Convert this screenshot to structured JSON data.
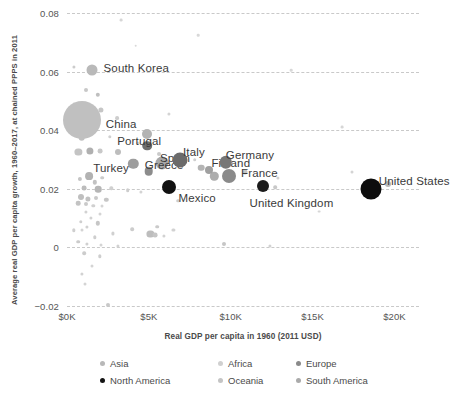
{
  "chart_data": {
    "type": "scatter",
    "title": "",
    "xlabel": "Real GDP per capita in 1960 (2011 USD)",
    "ylabel": "Average real GDP per capita growth, 1960–2017, at chained PPPS in 2011",
    "xlim": [
      0,
      21500
    ],
    "ylim": [
      -0.02,
      0.08
    ],
    "xticks": [
      {
        "value": 0,
        "label": "$0K"
      },
      {
        "value": 5000,
        "label": "$5K"
      },
      {
        "value": 10000,
        "label": "$10K"
      },
      {
        "value": 15000,
        "label": "$15K"
      },
      {
        "value": 20000,
        "label": "$20K"
      }
    ],
    "yticks": [
      {
        "value": 0.08,
        "label": "0.08"
      },
      {
        "value": 0.06,
        "label": "0.06"
      },
      {
        "value": 0.04,
        "label": "0.04"
      },
      {
        "value": 0.02,
        "label": "0.02"
      },
      {
        "value": 0,
        "label": "0"
      },
      {
        "value": -0.02,
        "label": "−0.02"
      }
    ],
    "grid": "horizontal-dashed",
    "legend_position": "bottom",
    "size_encoding": "population",
    "color_encoding": "continent",
    "legend": [
      {
        "name": "Asia",
        "color": "#b8b8b8"
      },
      {
        "name": "Africa",
        "color": "#d0d0d0"
      },
      {
        "name": "Europe",
        "color": "#8a8a8a"
      },
      {
        "name": "North America",
        "color": "#141414"
      },
      {
        "name": "Oceania",
        "color": "#c4c4c4"
      },
      {
        "name": "South America",
        "color": "#aaaaaa"
      }
    ],
    "labeled_points": [
      {
        "name": "South Korea",
        "x": 1500,
        "y": 0.0605,
        "r": 5.5,
        "color": "#b9b9b9",
        "label_dx": 12,
        "label_dy": -8
      },
      {
        "name": "China",
        "x": 900,
        "y": 0.0435,
        "r": 19,
        "color": "#c0c0c0",
        "label_dx": 24,
        "label_dy": -2
      },
      {
        "name": "Portugal",
        "x": 4900,
        "y": 0.0347,
        "r": 4.8,
        "color": "#6e6e6e",
        "label_dx": -30,
        "label_dy": -11
      },
      {
        "name": "Turkey",
        "x": 4050,
        "y": 0.0285,
        "r": 5.2,
        "color": "#9d9d9d",
        "label_dx": -40,
        "label_dy": -2
      },
      {
        "name": "Spain",
        "x": 5800,
        "y": 0.0287,
        "r": 6.5,
        "color": "#a8a8a8",
        "label_dx": -2,
        "label_dy": -11
      },
      {
        "name": "Greece",
        "x": 5000,
        "y": 0.026,
        "r": 4.3,
        "color": "#8c8c8c",
        "label_dx": -4,
        "label_dy": -12
      },
      {
        "name": "Italy",
        "x": 6900,
        "y": 0.03,
        "r": 7.5,
        "color": "#6b6b6b",
        "label_dx": 3,
        "label_dy": -14
      },
      {
        "name": "Mexico",
        "x": 6200,
        "y": 0.0205,
        "r": 7.0,
        "color": "#111111",
        "label_dx": 10,
        "label_dy": 5
      },
      {
        "name": "Finland",
        "x": 8700,
        "y": 0.0264,
        "r": 4.0,
        "color": "#a0a0a0",
        "label_dx": 2,
        "label_dy": -13
      },
      {
        "name": "Germany",
        "x": 9700,
        "y": 0.029,
        "r": 6.2,
        "color": "#777777",
        "label_dx": 0,
        "label_dy": -13
      },
      {
        "name": "France",
        "x": 9900,
        "y": 0.0243,
        "r": 7.0,
        "color": "#8a8a8a",
        "label_dx": 12,
        "label_dy": -9
      },
      {
        "name": "United Kingdom",
        "x": 12000,
        "y": 0.021,
        "r": 6.0,
        "color": "#1b1b1b",
        "label_dx": -14,
        "label_dy": 11
      },
      {
        "name": "United States",
        "x": 18550,
        "y": 0.0201,
        "r": 10.5,
        "color": "#0d0d0d",
        "label_dx": 8,
        "label_dy": -14
      }
    ],
    "unlabeled_points": [
      {
        "x": 400,
        "y": 0.0615,
        "r": 1.6,
        "color": "#cccccc"
      },
      {
        "x": 1150,
        "y": 0.0538,
        "r": 2.0,
        "color": "#c8c8c8"
      },
      {
        "x": 1900,
        "y": 0.052,
        "r": 2.2,
        "color": "#bfbfbf"
      },
      {
        "x": 1350,
        "y": 0.0478,
        "r": 3.2,
        "color": "#c2c2c2"
      },
      {
        "x": 2050,
        "y": 0.0468,
        "r": 2.6,
        "color": "#c6c6c6"
      },
      {
        "x": 1250,
        "y": 0.0468,
        "r": 5.8,
        "color": "#b4b4b4"
      },
      {
        "x": 400,
        "y": 0.049,
        "r": 1.5,
        "color": "#d2d2d2"
      },
      {
        "x": 1700,
        "y": 0.0418,
        "r": 1.8,
        "color": "#cfcfcf"
      },
      {
        "x": 3050,
        "y": 0.044,
        "r": 1.9,
        "color": "#cdcdcd"
      },
      {
        "x": 6200,
        "y": 0.0455,
        "r": 1.6,
        "color": "#d4d4d4"
      },
      {
        "x": 900,
        "y": 0.0375,
        "r": 3.3,
        "color": "#c0c0c0"
      },
      {
        "x": 2600,
        "y": 0.0378,
        "r": 1.7,
        "color": "#d0d0d0"
      },
      {
        "x": 4900,
        "y": 0.0387,
        "r": 5.0,
        "color": "#b3b3b3"
      },
      {
        "x": 4350,
        "y": 0.0358,
        "r": 1.6,
        "color": "#d2d2d2"
      },
      {
        "x": 700,
        "y": 0.0327,
        "r": 3.6,
        "color": "#c4c4c4"
      },
      {
        "x": 1400,
        "y": 0.0328,
        "r": 3.6,
        "color": "#b0b0b0"
      },
      {
        "x": 2000,
        "y": 0.0328,
        "r": 2.4,
        "color": "#c8c8c8"
      },
      {
        "x": 3100,
        "y": 0.0327,
        "r": 3.0,
        "color": "#bdbdbd"
      },
      {
        "x": 5600,
        "y": 0.032,
        "r": 2.0,
        "color": "#cacaca"
      },
      {
        "x": 7800,
        "y": 0.03,
        "r": 1.8,
        "color": "#cfcfcf"
      },
      {
        "x": 8200,
        "y": 0.0272,
        "r": 3.3,
        "color": "#b4b4b4"
      },
      {
        "x": 9000,
        "y": 0.0243,
        "r": 4.2,
        "color": "#adadad"
      },
      {
        "x": 10900,
        "y": 0.0258,
        "r": 2.5,
        "color": "#c5c5c5"
      },
      {
        "x": 12900,
        "y": 0.0238,
        "r": 1.6,
        "color": "#d2d2d2"
      },
      {
        "x": 19600,
        "y": 0.0215,
        "r": 3.0,
        "color": "#b8b8b8"
      },
      {
        "x": 12700,
        "y": 0.0205,
        "r": 1.8,
        "color": "#c8c8c8"
      },
      {
        "x": 1350,
        "y": 0.0243,
        "r": 3.9,
        "color": "#b2b2b2"
      },
      {
        "x": 2150,
        "y": 0.0238,
        "r": 1.8,
        "color": "#cbcbcb"
      },
      {
        "x": 800,
        "y": 0.0235,
        "r": 2.1,
        "color": "#c4c4c4"
      },
      {
        "x": 1700,
        "y": 0.0222,
        "r": 2.2,
        "color": "#c2c2c2"
      },
      {
        "x": 1050,
        "y": 0.0203,
        "r": 2.4,
        "color": "#bcbcbc"
      },
      {
        "x": 1900,
        "y": 0.0198,
        "r": 3.3,
        "color": "#b6b6b6"
      },
      {
        "x": 2700,
        "y": 0.0202,
        "r": 1.7,
        "color": "#d0d0d0"
      },
      {
        "x": 3700,
        "y": 0.0195,
        "r": 1.8,
        "color": "#cdcdcd"
      },
      {
        "x": 4500,
        "y": 0.019,
        "r": 1.6,
        "color": "#d4d4d4"
      },
      {
        "x": 850,
        "y": 0.0172,
        "r": 3.0,
        "color": "#bfbfbf"
      },
      {
        "x": 1300,
        "y": 0.0165,
        "r": 2.6,
        "color": "#c1c1c1"
      },
      {
        "x": 1800,
        "y": 0.0168,
        "r": 2.0,
        "color": "#c9c9c9"
      },
      {
        "x": 2400,
        "y": 0.0163,
        "r": 2.2,
        "color": "#c6c6c6"
      },
      {
        "x": 700,
        "y": 0.015,
        "r": 2.3,
        "color": "#c3c3c3"
      },
      {
        "x": 1150,
        "y": 0.0148,
        "r": 2.0,
        "color": "#cacaca"
      },
      {
        "x": 1600,
        "y": 0.0143,
        "r": 1.7,
        "color": "#d0d0d0"
      },
      {
        "x": 2150,
        "y": 0.014,
        "r": 1.5,
        "color": "#d4d4d4"
      },
      {
        "x": 6800,
        "y": 0.016,
        "r": 1.8,
        "color": "#cccccc"
      },
      {
        "x": 1150,
        "y": 0.012,
        "r": 1.6,
        "color": "#d2d2d2"
      },
      {
        "x": 2000,
        "y": 0.0113,
        "r": 1.5,
        "color": "#d4d4d4"
      },
      {
        "x": 1450,
        "y": 0.01,
        "r": 1.6,
        "color": "#d2d2d2"
      },
      {
        "x": 850,
        "y": 0.0088,
        "r": 1.7,
        "color": "#cfcfcf"
      },
      {
        "x": 1900,
        "y": 0.0082,
        "r": 2.2,
        "color": "#c6c6c6"
      },
      {
        "x": 1200,
        "y": 0.007,
        "r": 1.6,
        "color": "#d0d0d0"
      },
      {
        "x": 400,
        "y": 0.0058,
        "r": 1.7,
        "color": "#cfcfcf"
      },
      {
        "x": 900,
        "y": 0.0058,
        "r": 1.5,
        "color": "#d4d4d4"
      },
      {
        "x": 4000,
        "y": 0.0062,
        "r": 1.8,
        "color": "#cccccc"
      },
      {
        "x": 5500,
        "y": 0.007,
        "r": 1.8,
        "color": "#cacaca"
      },
      {
        "x": 6500,
        "y": 0.006,
        "r": 1.6,
        "color": "#d2d2d2"
      },
      {
        "x": 2800,
        "y": 0.0048,
        "r": 1.6,
        "color": "#d0d0d0"
      },
      {
        "x": 5100,
        "y": 0.0045,
        "r": 3.6,
        "color": "#bdbdbd"
      },
      {
        "x": 5400,
        "y": 0.0042,
        "r": 2.4,
        "color": "#c5c5c5"
      },
      {
        "x": 5900,
        "y": 0.0038,
        "r": 1.6,
        "color": "#d2d2d2"
      },
      {
        "x": 1700,
        "y": 0.0035,
        "r": 1.7,
        "color": "#cecece"
      },
      {
        "x": 700,
        "y": 0.002,
        "r": 1.8,
        "color": "#cbcbcb"
      },
      {
        "x": 1200,
        "y": 0.0012,
        "r": 1.6,
        "color": "#d0d0d0"
      },
      {
        "x": 2050,
        "y": 0.0008,
        "r": 1.5,
        "color": "#d4d4d4"
      },
      {
        "x": 3100,
        "y": 0.0005,
        "r": 1.6,
        "color": "#d2d2d2"
      },
      {
        "x": 9600,
        "y": 0.001,
        "r": 2.0,
        "color": "#c6c6c6"
      },
      {
        "x": 12400,
        "y": 0.0004,
        "r": 1.6,
        "color": "#d2d2d2"
      },
      {
        "x": 1050,
        "y": -0.002,
        "r": 1.8,
        "color": "#cccccc"
      },
      {
        "x": 2000,
        "y": -0.003,
        "r": 1.7,
        "color": "#cecece"
      },
      {
        "x": 1500,
        "y": -0.0065,
        "r": 1.5,
        "color": "#d4d4d4"
      },
      {
        "x": 900,
        "y": -0.009,
        "r": 1.6,
        "color": "#d2d2d2"
      },
      {
        "x": 1100,
        "y": -0.0125,
        "r": 1.5,
        "color": "#d4d4d4"
      },
      {
        "x": 2500,
        "y": -0.0195,
        "r": 2.0,
        "color": "#c8c8c8"
      },
      {
        "x": 3300,
        "y": 0.0775,
        "r": 1.4,
        "color": "#d6d6d6"
      },
      {
        "x": 8000,
        "y": 0.0725,
        "r": 1.3,
        "color": "#d8d8d8"
      },
      {
        "x": 13700,
        "y": 0.0605,
        "r": 1.3,
        "color": "#d8d8d8"
      },
      {
        "x": 16800,
        "y": 0.041,
        "r": 1.4,
        "color": "#d6d6d6"
      },
      {
        "x": 17400,
        "y": 0.0258,
        "r": 1.5,
        "color": "#d4d4d4"
      },
      {
        "x": 15400,
        "y": 0.0122,
        "r": 1.4,
        "color": "#d6d6d6"
      },
      {
        "x": 4200,
        "y": 0.0688,
        "r": 1.3,
        "color": "#d8d8d8"
      }
    ]
  }
}
